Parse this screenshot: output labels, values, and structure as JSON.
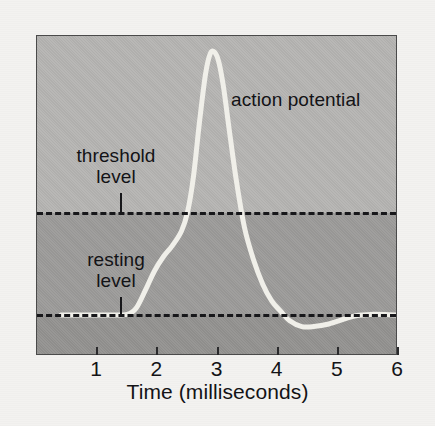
{
  "figure": {
    "background_color": "#f3f2f0",
    "plot_background_upper": "#b6b5b3",
    "plot_background_middle": "#9d9c9a",
    "plot_background_lower": "#949391",
    "curve_color": "#f0efe9",
    "line_color": "#17171a",
    "text_color": "#131316"
  },
  "labels": {
    "action_potential": "action potential",
    "threshold_line1": "threshold",
    "threshold_line2": "level",
    "resting_line1": "resting",
    "resting_line2": "level"
  },
  "axis": {
    "x_title": "Time (milliseconds)",
    "x_ticks": [
      "1",
      "2",
      "3",
      "4",
      "5",
      "6"
    ]
  },
  "chart_data": {
    "type": "line",
    "title": "",
    "xlabel": "Time (milliseconds)",
    "ylabel": "",
    "xlim": [
      0,
      6
    ],
    "ylim": [
      0,
      1
    ],
    "grid": false,
    "legend": "none",
    "xticks": [
      1,
      2,
      3,
      4,
      5,
      6
    ],
    "xticklabels": [
      "1",
      "2",
      "3",
      "4",
      "5",
      "6"
    ],
    "annotations": [
      {
        "text": "action potential",
        "x": 3.25,
        "y": 0.88
      },
      {
        "text": "threshold level",
        "x": 1.19,
        "y": 0.62
      },
      {
        "text": "resting level",
        "x": 1.19,
        "y": 0.29
      }
    ],
    "reference_lines": [
      {
        "name": "threshold level",
        "y": 0.448,
        "style": "dashed",
        "color": "#17171a"
      },
      {
        "name": "resting level",
        "y": 0.128,
        "style": "dashed",
        "color": "#17171a"
      }
    ],
    "series": [
      {
        "name": "membrane potential",
        "color": "#f0efe9",
        "x": [
          0.4,
          0.8,
          1.2,
          1.5,
          1.65,
          1.8,
          1.95,
          2.1,
          2.25,
          2.4,
          2.5,
          2.6,
          2.7,
          2.8,
          2.88,
          2.95,
          3.02,
          3.1,
          3.2,
          3.32,
          3.45,
          3.6,
          3.75,
          3.9,
          4.05,
          4.2,
          4.4,
          4.6,
          4.85,
          5.1,
          5.3,
          5.55,
          5.85,
          6.0
        ],
        "y": [
          0.128,
          0.128,
          0.128,
          0.13,
          0.15,
          0.205,
          0.265,
          0.31,
          0.345,
          0.39,
          0.448,
          0.56,
          0.73,
          0.88,
          0.945,
          0.95,
          0.92,
          0.84,
          0.7,
          0.54,
          0.4,
          0.3,
          0.225,
          0.172,
          0.14,
          0.11,
          0.092,
          0.092,
          0.1,
          0.115,
          0.126,
          0.13,
          0.129,
          0.128
        ]
      }
    ]
  }
}
